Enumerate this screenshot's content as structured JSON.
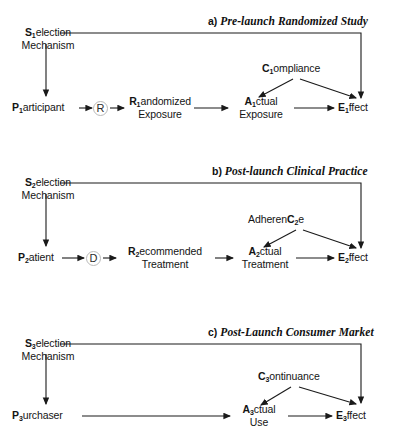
{
  "figure": {
    "kind": "causal-diagram-three-panels",
    "background": "#ffffff",
    "stroke": "#1a1a1a"
  },
  "panels": [
    {
      "id": "a",
      "tag": "a)",
      "title": "Pre-launch Randomized Study",
      "selection": {
        "bold": "S",
        "sub": "1",
        "rest": "election",
        "line2": "Mechanism"
      },
      "unit": {
        "bold": "P",
        "sub": "1",
        "rest": "articipant"
      },
      "assign_node": "R",
      "assigned": {
        "bold": "R",
        "sub": "1",
        "rest": "andomized",
        "line2": "Exposure"
      },
      "actual": {
        "bold": "A",
        "sub": "1",
        "rest": "ctual",
        "line2": "Exposure"
      },
      "mediator": {
        "pre": "",
        "bold": "C",
        "sub": "1",
        "post": "ompliance"
      },
      "outcome": {
        "bold": "E",
        "sub": "1",
        "rest": "ffect"
      }
    },
    {
      "id": "b",
      "tag": "b)",
      "title": "Post-launch Clinical Practice",
      "selection": {
        "bold": "S",
        "sub": "2",
        "rest": "election",
        "line2": "Mechanism"
      },
      "unit": {
        "bold": "P",
        "sub": "2",
        "rest": "atient"
      },
      "assign_node": "D",
      "assigned": {
        "bold": "R",
        "sub": "2",
        "rest": "ecommended",
        "line2": "Treatment"
      },
      "actual": {
        "bold": "A",
        "sub": "2",
        "rest": "ctual",
        "line2": "Treatment"
      },
      "mediator": {
        "pre": "Adheren",
        "bold": "C",
        "sub": "2",
        "post": "e"
      },
      "outcome": {
        "bold": "E",
        "sub": "2",
        "rest": "ffect"
      }
    },
    {
      "id": "c",
      "tag": "c)",
      "title": "Post-Launch Consumer Market",
      "selection": {
        "bold": "S",
        "sub": "3",
        "rest": "election",
        "line2": "Mechanism"
      },
      "unit": {
        "bold": "P",
        "sub": "3",
        "rest": "urchaser"
      },
      "assign_node": "",
      "assigned": {
        "bold": "",
        "sub": "",
        "rest": "",
        "line2": ""
      },
      "actual": {
        "bold": "A",
        "sub": "3",
        "rest": "ctual",
        "line2": "Use"
      },
      "mediator": {
        "pre": "",
        "bold": "C",
        "sub": "3",
        "post": "ontinuance"
      },
      "outcome": {
        "bold": "E",
        "sub": "3",
        "rest": "ffect"
      }
    }
  ]
}
